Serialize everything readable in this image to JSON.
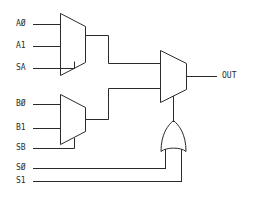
{
  "diagram": {
    "stroke_color": "#2b2b2b",
    "background_color": "#ffffff"
  },
  "labels": {
    "a0": "AØ",
    "a1": "A1",
    "sa": "SA",
    "b0": "BØ",
    "b1": "B1",
    "sb": "SB",
    "s0": "SØ",
    "s1": "S1",
    "out": "OUT"
  },
  "components": [
    {
      "name": "mux-a",
      "kind": "multiplexer",
      "inputs": [
        "AØ",
        "A1"
      ],
      "select": "SA",
      "output": "to mux-out input 0"
    },
    {
      "name": "mux-b",
      "kind": "multiplexer",
      "inputs": [
        "BØ",
        "B1"
      ],
      "select": "SB",
      "output": "to mux-out input 1"
    },
    {
      "name": "mux-out",
      "kind": "multiplexer",
      "inputs": [
        "mux-a output",
        "mux-b output"
      ],
      "select": "or-gate output",
      "output": "OUT"
    },
    {
      "name": "or-gate",
      "kind": "or",
      "inputs": [
        "SØ",
        "S1"
      ],
      "output": "mux-out select"
    }
  ]
}
